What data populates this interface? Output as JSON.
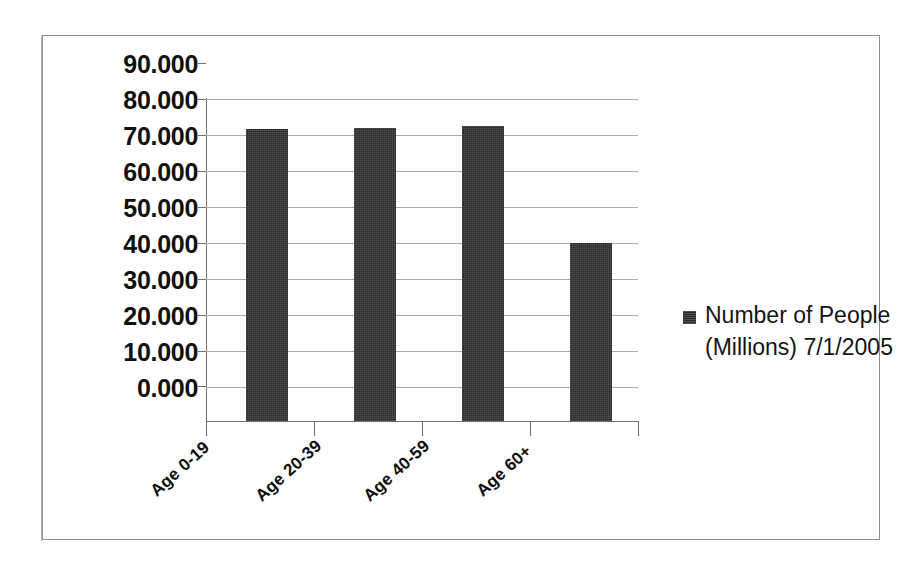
{
  "chart_data": {
    "type": "bar",
    "title": "",
    "xlabel": "",
    "ylabel": "",
    "categories": [
      "Age 0-19",
      "Age 20-39",
      "Age 40-59",
      "Age 60+"
    ],
    "values": [
      81.5,
      82.0,
      82.5,
      49.9
    ],
    "series": [
      {
        "name": "Number of People (Millions) 7/1/2005",
        "values": [
          81.5,
          82.0,
          82.5,
          49.9
        ]
      }
    ],
    "ylim": [
      0,
      90
    ],
    "ytick_step": 10,
    "ytick_labels": [
      "90.000",
      "80.000",
      "70.000",
      "60.000",
      "50.000",
      "40.000",
      "30.000",
      "20.000",
      "10.000",
      "0.000"
    ],
    "ytick_values": [
      90,
      80,
      70,
      60,
      50,
      40,
      30,
      20,
      10,
      0
    ],
    "grid": true,
    "legend_position": "right",
    "bar_color": "#2e2e2e",
    "gridline_color": "#adadaf",
    "axis_color": "#6f6f71"
  },
  "legend": {
    "line1": "Number of People",
    "line2": "(Millions) 7/1/2005",
    "marker": "filled-square"
  }
}
